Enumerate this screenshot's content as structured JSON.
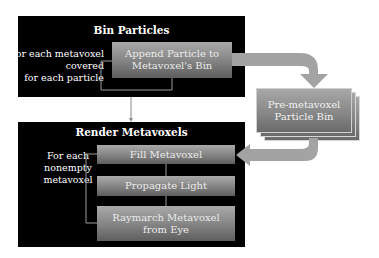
{
  "bin_particles": {
    "title": "Bin Particles",
    "loop_label_lines": [
      "For each metavoxel",
      "covered",
      "for each particle"
    ],
    "step": [
      "Append Particle to",
      "Metavoxel's Bin"
    ]
  },
  "pre_metavoxel_bin": {
    "label_lines": [
      "Pre-metavoxel",
      "Particle Bin"
    ]
  },
  "render_metavoxels": {
    "title": "Render Metavoxels",
    "loop_label_lines": [
      "For each",
      "nonempty",
      "metavoxel"
    ],
    "steps": [
      {
        "lines": [
          "Fill Metavoxel"
        ]
      },
      {
        "lines": [
          "Propagate Light"
        ]
      },
      {
        "lines": [
          "Raymarch Metavoxel",
          "from Eye"
        ]
      }
    ]
  },
  "colors": {
    "panel": "#000000",
    "box_top": "#a9a9a9",
    "box_bottom": "#5e5e5e",
    "arrow": "#a0a0a0",
    "text": "#ffffff"
  }
}
